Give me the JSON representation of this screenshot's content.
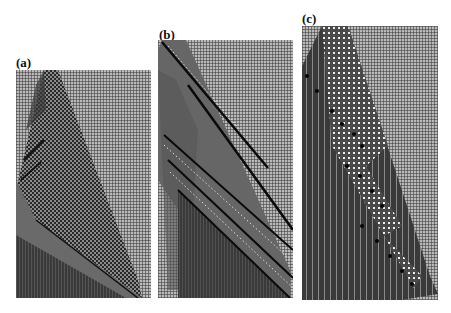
{
  "figure": {
    "panels": [
      {
        "id": "a",
        "label": "(a)",
        "description": "Cellular automaton space-time diagram: triangular region spreading right from a narrow top, dark checkered core, lighter diagonal band, dark lower-left region"
      },
      {
        "id": "b",
        "label": "(b)",
        "description": "Cellular automaton space-time diagram: diagonal band with multiple parallel dark diagonal lines and dotted white trails, dark triangular region at lower left"
      },
      {
        "id": "c",
        "label": "(c)",
        "description": "Cellular automaton space-time diagram: dark vertical-striped region on left, diagonal band of white dotted lattice with black dots moving down-right in steps"
      }
    ]
  },
  "colors": {
    "background_grid": "#b9b9b9",
    "dark_region": "#3c3c3c",
    "mid_band": "#6e6e6e",
    "black_lines": "#0a0a0a",
    "white_dots": "#f0f0f0"
  }
}
